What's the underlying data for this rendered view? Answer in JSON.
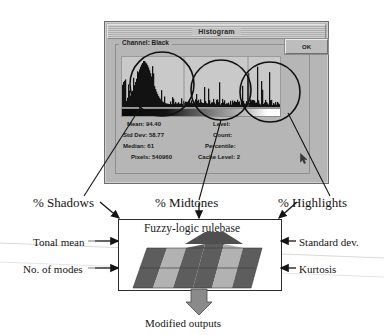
{
  "dialog": {
    "title": "Histogram",
    "group_label": "Channel: Black",
    "ok_label": "OK",
    "stats_left": [
      {
        "label": "Mean:",
        "value": "94.40"
      },
      {
        "label": "Std Dev:",
        "value": "58.77"
      },
      {
        "label": "Median:",
        "value": "61"
      },
      {
        "label": "Pixels:",
        "value": "540960"
      }
    ],
    "stats_right": [
      {
        "label": "Level:",
        "value": ""
      },
      {
        "label": "Count:",
        "value": ""
      },
      {
        "label": "Percentile:",
        "value": ""
      },
      {
        "label": "Cache Level:",
        "value": "2"
      }
    ],
    "cursor_icon": "mouse-pointer-icon"
  },
  "diagram": {
    "inputs_top": [
      "% Shadows",
      "% Midtones",
      "% Highlights"
    ],
    "inputs_left": [
      "Tonal mean",
      "No. of modes"
    ],
    "inputs_right": [
      "Standard dev.",
      "Kurtosis"
    ],
    "block_label": "Fuzzy-logic rulebase",
    "output_label": "Modified outputs"
  },
  "colors": {
    "dialog_face": "#b6b6b6",
    "dialog_border": "#6d6d6d",
    "ink": "#141414",
    "stripe_dark": "#5a5a5a",
    "stripe_light": "#b0b0b0",
    "arrow_fill": "#8a8a8a"
  },
  "histogram_overlay": {
    "circles": [
      {
        "name": "shadows-circle",
        "cx": 162,
        "cy": 84,
        "r": 32
      },
      {
        "name": "midtones-circle",
        "cx": 221,
        "cy": 90,
        "r": 30
      },
      {
        "name": "highlights-circle",
        "cx": 270,
        "cy": 92,
        "r": 30
      }
    ]
  }
}
